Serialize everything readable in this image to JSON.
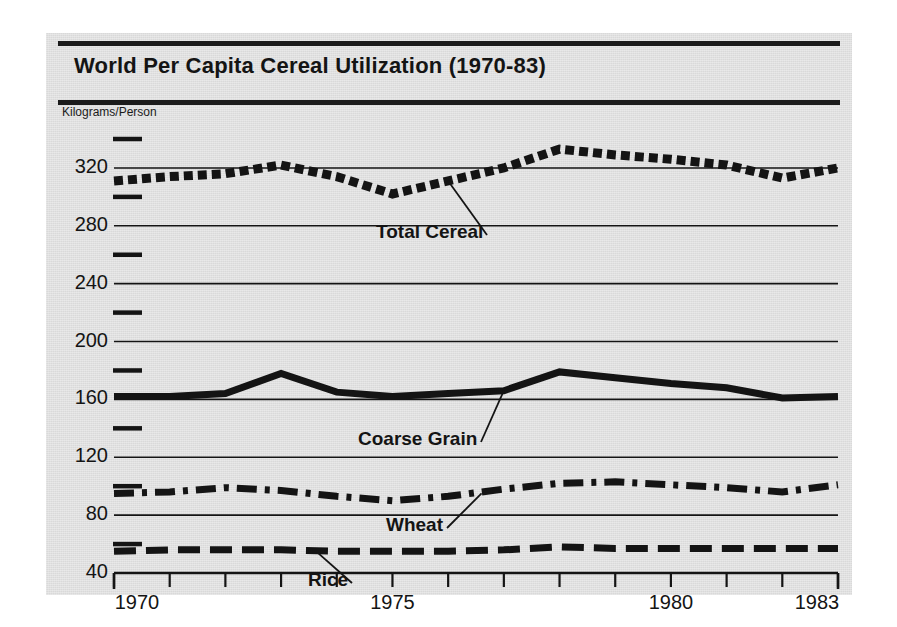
{
  "figure": {
    "title": "World Per Capita Cereal Utilization (1970-83)",
    "background_color": "#d9d9d9",
    "ink_color": "#141414"
  },
  "chart_data": {
    "type": "line",
    "title": "World Per Capita Cereal Utilization (1970-83)",
    "xlabel": "",
    "ylabel": "Kilograms/Person",
    "x": [
      1970,
      1971,
      1972,
      1973,
      1974,
      1975,
      1976,
      1977,
      1978,
      1979,
      1980,
      1981,
      1982,
      1983
    ],
    "xlim": [
      1970,
      1983
    ],
    "ylim": [
      40,
      340
    ],
    "xtick_labels": [
      "1970",
      "1975",
      "1980",
      "1983"
    ],
    "xticks_major": [
      1970,
      1975,
      1980,
      1983
    ],
    "xticks_all": [
      1970,
      1971,
      1972,
      1973,
      1974,
      1975,
      1976,
      1977,
      1978,
      1979,
      1980,
      1981,
      1982,
      1983
    ],
    "ytick_labels": [
      "40",
      "80",
      "120",
      "160",
      "200",
      "240",
      "280",
      "320"
    ],
    "yticks_major": [
      40,
      80,
      120,
      160,
      200,
      240,
      280,
      320
    ],
    "yticks_minor": [
      60,
      100,
      140,
      180,
      220,
      260,
      300,
      340
    ],
    "grid": true,
    "legend_position": "inline-annotations",
    "series": [
      {
        "name": "Total Cereal",
        "style": "dotted",
        "values": [
          311,
          314,
          316,
          322,
          314,
          302,
          311,
          320,
          333,
          329,
          326,
          322,
          313,
          320
        ]
      },
      {
        "name": "Coarse Grain",
        "style": "solid",
        "values": [
          162,
          162,
          164,
          178,
          165,
          162,
          164,
          166,
          179,
          175,
          171,
          168,
          161,
          162
        ]
      },
      {
        "name": "Wheat",
        "style": "dash-dot",
        "values": [
          95,
          96,
          99,
          97,
          93,
          90,
          93,
          98,
          102,
          103,
          101,
          99,
          96,
          101
        ]
      },
      {
        "name": "Rice",
        "style": "dashed",
        "values": [
          55,
          56,
          56,
          56,
          55,
          55,
          55,
          56,
          58,
          57,
          57,
          57,
          57,
          57
        ]
      }
    ],
    "annotations": [
      {
        "text": "Total Cereal",
        "target_x": 1976.0,
        "target_y": 311
      },
      {
        "text": "Coarse Grain",
        "target_x": 1977.0,
        "target_y": 166
      },
      {
        "text": "Wheat",
        "target_x": 1976.6,
        "target_y": 95
      },
      {
        "text": "Rice",
        "target_x": 1973.6,
        "target_y": 56
      }
    ]
  }
}
